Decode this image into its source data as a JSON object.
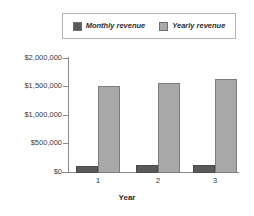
{
  "chart_data": {
    "type": "bar",
    "title": "",
    "xlabel": "Year",
    "ylabel": "",
    "categories": [
      "1",
      "2",
      "3"
    ],
    "series": [
      {
        "name": "Monthly revenue",
        "values": [
          130000,
          132000,
          137000
        ],
        "color": "#5a5a5a"
      },
      {
        "name": "Yearly revenue",
        "values": [
          1525000,
          1580000,
          1650000
        ],
        "color": "#a8a8a8"
      }
    ],
    "ylim": [
      0,
      2000000
    ],
    "ytick_values": [
      2000000,
      1500000,
      1000000,
      500000,
      0
    ],
    "ytick_labels": [
      "$2,000,000",
      "$1,500,000",
      "$1,000,000",
      "$500,000",
      "$0"
    ],
    "grid": false,
    "legend_position": "top"
  },
  "legend": {
    "entries": [
      {
        "label": "Monthly revenue",
        "swatch": "monthly-swatch"
      },
      {
        "label": "Yearly revenue",
        "swatch": "yearly-swatch"
      }
    ]
  }
}
